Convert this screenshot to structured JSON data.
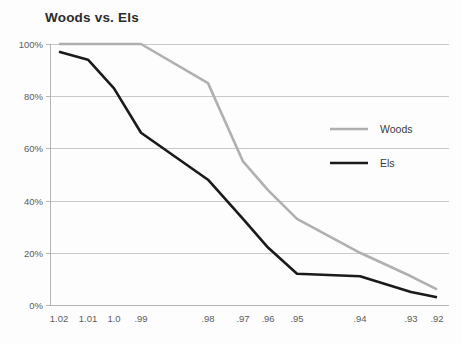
{
  "chart_data": {
    "type": "line",
    "title": "Woods vs. Els",
    "xlabel": "",
    "ylabel": "",
    "grid": true,
    "legend_position": "right",
    "x": [
      1.02,
      1.01,
      1.0,
      0.99,
      0.98,
      0.97,
      0.96,
      0.95,
      0.94,
      0.93,
      0.92
    ],
    "xtick_labels": [
      "1.02",
      "1.01",
      "1.0",
      ".99",
      ".98",
      ".97",
      ".96",
      ".95",
      ".94",
      ".93",
      ".92"
    ],
    "xtick_positions": [
      59,
      88,
      114,
      141,
      208,
      243,
      268,
      297,
      360,
      411,
      437
    ],
    "ytick_labels": [
      "100%",
      "80%",
      "60%",
      "40%",
      "20%",
      "0%"
    ],
    "ytick_values": [
      100,
      80,
      60,
      40,
      20,
      0
    ],
    "ylim": [
      0,
      100
    ],
    "series": [
      {
        "name": "Woods",
        "color": "#b0b0b0",
        "width": 2.6,
        "values": [
          100,
          100,
          100,
          100,
          85,
          55,
          44,
          33,
          20,
          11,
          6
        ]
      },
      {
        "name": "Els",
        "color": "#1a1a1a",
        "width": 2.6,
        "values": [
          97,
          94,
          83,
          66,
          48,
          33,
          22,
          12,
          11,
          5,
          3
        ]
      }
    ]
  },
  "legend": {
    "items": [
      {
        "label": "Woods",
        "color": "#b0b0b0"
      },
      {
        "label": "Els",
        "color": "#1a1a1a"
      }
    ]
  },
  "colors": {
    "background": "#fdfdfd",
    "grid": "#c9c9c9",
    "axis": "#b4b4b4",
    "title_text": "#2b2b2b",
    "tick_text": "#5c5c5c"
  }
}
